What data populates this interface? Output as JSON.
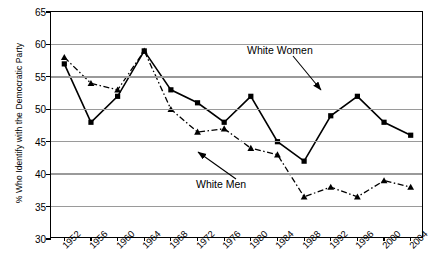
{
  "chart_data": {
    "type": "line",
    "title": "",
    "xlabel": "",
    "ylabel": "% Who Identify with the Democratic Party",
    "ylim": [
      30,
      65
    ],
    "ytick_step": 5,
    "yticks": [
      65,
      60,
      55,
      50,
      45,
      40,
      35,
      30
    ],
    "grid": true,
    "legend_position": "inline-annotations",
    "categories": [
      "1952",
      "1956",
      "1960",
      "1964",
      "1968",
      "1972",
      "1976",
      "1980",
      "1984",
      "1988",
      "1992",
      "1996",
      "2000",
      "2004"
    ],
    "series": [
      {
        "name": "White Women",
        "marker": "square",
        "line_style": "solid",
        "color": "#000000",
        "values": [
          57,
          48,
          52,
          59,
          53,
          51,
          48,
          52,
          45,
          42,
          49,
          52,
          48,
          46
        ]
      },
      {
        "name": "White Men",
        "marker": "triangle",
        "line_style": "dash-dot",
        "color": "#000000",
        "values": [
          58,
          54,
          53,
          59,
          50,
          46.5,
          47,
          44,
          43,
          36.5,
          38,
          36.5,
          39,
          38
        ]
      }
    ],
    "annotations": [
      {
        "text": "White Women",
        "target_series": "White Women",
        "target_category": "1992"
      },
      {
        "text": "White Men",
        "target_series": "White Men",
        "target_category": "1984"
      }
    ]
  }
}
